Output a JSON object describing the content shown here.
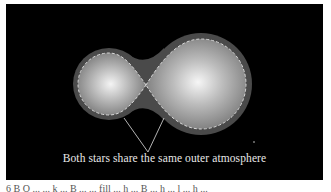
{
  "figure": {
    "label": "Both stars share the same outer atmosphere",
    "caption_partial": "6 B  O ...  ... k ...  B ...  ... fill ... h ...  B ... h ... l ... h ...",
    "colors": {
      "background": "#000000",
      "envelope": "#4a4a4a",
      "star_core": "#f2f2f2",
      "star_edge": "#8a8a8a",
      "dashed_line": "#d8d8d8",
      "leader_line": "#e0e0e0"
    },
    "stars": [
      {
        "name": "smaller-star",
        "cx": 103,
        "cy": 80,
        "r_envelope": 36,
        "r_roche": 31
      },
      {
        "name": "larger-star",
        "cx": 195,
        "cy": 80,
        "r_envelope": 51,
        "r_roche": 45
      }
    ],
    "contact_point": {
      "x": 140,
      "y": 81
    }
  }
}
